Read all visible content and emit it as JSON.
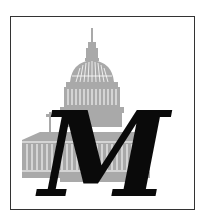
{
  "logo": {
    "letter": "M",
    "alt": "Capitol building with letter M",
    "colors": {
      "border": "#333333",
      "building": "#a9a9a9",
      "building_detail": "#ffffff",
      "letter": "#0a0a0a",
      "background": "#ffffff"
    },
    "icons": [
      "capitol-building-icon"
    ]
  }
}
